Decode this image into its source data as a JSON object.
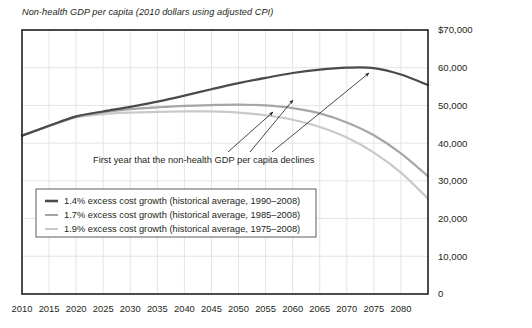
{
  "chart_data": {
    "type": "line",
    "title": "Non-health GDP per capita (2010 dollars using adjusted CPI)",
    "xlabel": "",
    "ylabel": "",
    "xlim": [
      2010,
      2085
    ],
    "ylim": [
      0,
      70000
    ],
    "grid": true,
    "legend_position": "inside-lower-left",
    "x_ticks": [
      2010,
      2015,
      2020,
      2025,
      2030,
      2035,
      2040,
      2045,
      2050,
      2055,
      2060,
      2065,
      2070,
      2075,
      2080
    ],
    "x_tick_labels": [
      "2010",
      "2015",
      "2020",
      "2025",
      "2030",
      "2035",
      "2040",
      "2045",
      "2050",
      "2055",
      "2060",
      "2065",
      "2070",
      "2075",
      "2080"
    ],
    "y_ticks": [
      0,
      10000,
      20000,
      30000,
      40000,
      50000,
      60000,
      70000
    ],
    "y_tick_labels": [
      "0",
      "10,000",
      "20,000",
      "30,000",
      "40,000",
      "50,000",
      "60,000",
      "$70,000"
    ],
    "x": [
      2010,
      2015,
      2020,
      2025,
      2030,
      2035,
      2040,
      2045,
      2050,
      2055,
      2060,
      2065,
      2070,
      2075,
      2080,
      2085
    ],
    "series": [
      {
        "name": "1.4% excess cost growth (historical average, 1990–2008)",
        "color": "#4a4a4a",
        "width": 2.2,
        "peak_year": 2068,
        "peak_value": 60100,
        "values": [
          42000,
          44600,
          47100,
          48400,
          49600,
          51000,
          52600,
          54300,
          55900,
          57300,
          58600,
          59500,
          60000,
          59900,
          58200,
          55400
        ]
      },
      {
        "name": "1.7% excess cost growth (historical average, 1985–2008)",
        "color": "#a6a6a6",
        "width": 2.2,
        "peak_year": 2052,
        "peak_value": 50200,
        "values": [
          42000,
          44600,
          47000,
          48200,
          49000,
          49500,
          49900,
          50100,
          50200,
          50000,
          49300,
          47900,
          45500,
          42100,
          37300,
          31200
        ]
      },
      {
        "name": "1.9% excess cost growth (historical average, 1975–2008)",
        "color": "#c9c9c9",
        "width": 2.2,
        "peak_year": 2046,
        "peak_value": 48400,
        "values": [
          42000,
          44500,
          46800,
          47700,
          48100,
          48300,
          48400,
          48400,
          48100,
          47400,
          46200,
          44300,
          41500,
          37500,
          32200,
          25300
        ]
      }
    ],
    "annotation": {
      "text": "First year that the non-health GDP per capita declines",
      "text_x": 93,
      "text_y": 163,
      "arrows": [
        {
          "target": "1.9% series peak",
          "x1": 228,
          "y1": 152,
          "x2": 273,
          "y2": 112
        },
        {
          "target": "1.7% series peak",
          "x1": 250,
          "y1": 152,
          "x2": 293,
          "y2": 100
        },
        {
          "target": "1.4% series peak",
          "x1": 272,
          "y1": 152,
          "x2": 369,
          "y2": 73
        }
      ]
    },
    "legend_box": {
      "x": 36,
      "y": 189,
      "width": 280,
      "height": 48
    }
  },
  "plot_area": {
    "left": 22,
    "top": 30,
    "right": 428,
    "bottom": 294
  },
  "colors": {
    "axis": "#231f20",
    "grid": "#e4e4e4",
    "text": "#231f20",
    "series_dark": "#4a4a4a",
    "series_mid": "#a6a6a6",
    "series_light": "#c9c9c9"
  }
}
